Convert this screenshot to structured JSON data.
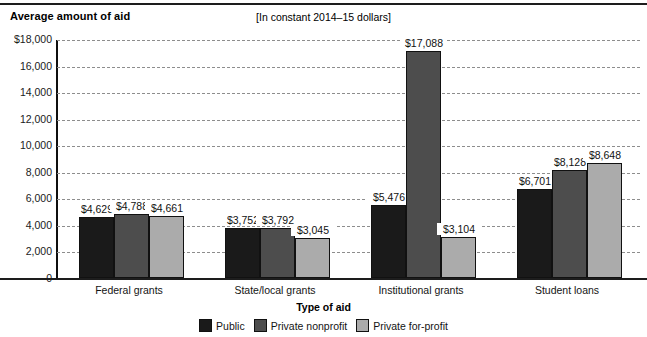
{
  "chart_data": {
    "type": "bar",
    "title": "Average amount of aid",
    "subtitle": "[In constant 2014–15 dollars]",
    "xlabel": "Type of aid",
    "ylabel": "",
    "ylim": [
      0,
      18000
    ],
    "ytick_labels": [
      "$18,000",
      "16,000",
      "14,000",
      "12,000",
      "10,000",
      "8,000",
      "6,000",
      "4,000",
      "2,000",
      "0"
    ],
    "ytick_values": [
      18000,
      16000,
      14000,
      12000,
      10000,
      8000,
      6000,
      4000,
      2000,
      0
    ],
    "grid": true,
    "legend_position": "bottom",
    "categories": [
      "Federal grants",
      "State/local grants",
      "Institutional grants",
      "Student loans"
    ],
    "series": [
      {
        "name": "Public",
        "color": "#1a1a1a",
        "values": [
          4629,
          3752,
          5476,
          6701
        ],
        "labels": [
          "$4,629",
          "$3,752",
          "$5,476",
          "$6,701"
        ]
      },
      {
        "name": "Private nonprofit",
        "color": "#4d4d4d",
        "values": [
          4788,
          3792,
          17088,
          8128
        ],
        "labels": [
          "$4,788",
          "$3,792",
          "$17,088",
          "$8,128"
        ]
      },
      {
        "name": "Private for-profit",
        "color": "#ababab",
        "values": [
          4661,
          3045,
          3104,
          8648
        ],
        "labels": [
          "$4,661",
          "$3,045",
          "$3,104",
          "$8,648"
        ]
      }
    ]
  }
}
